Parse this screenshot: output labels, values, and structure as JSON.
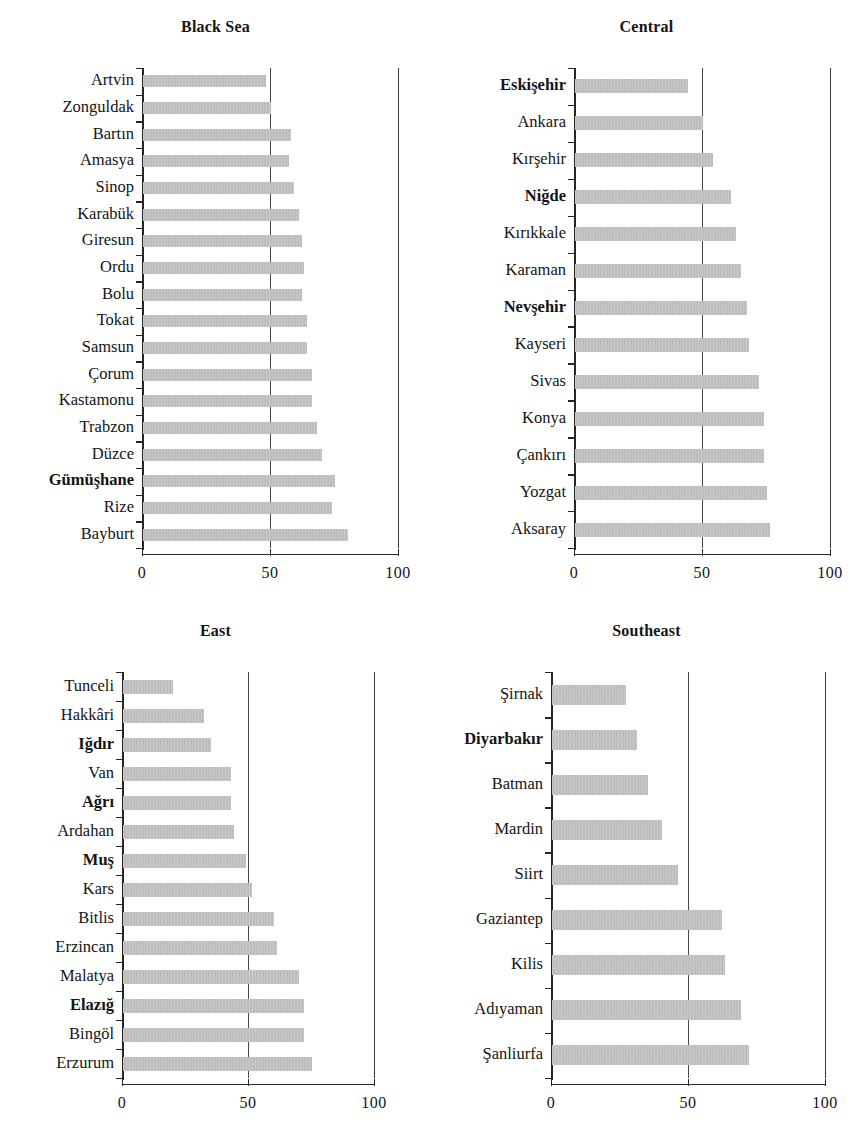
{
  "figure": {
    "background": "#ffffff",
    "bar_color": "#b9b9b9",
    "axis_color": "#262626"
  },
  "chart_data": {
    "type": "bar",
    "orientation": "horizontal",
    "title": "",
    "xlabel": "",
    "ylabel": "",
    "xlim": [
      0,
      100
    ],
    "xticks": [
      0,
      50,
      100
    ],
    "xtick_labels": [
      "0",
      "50",
      "100"
    ],
    "grid": false,
    "reference_lines": [
      50,
      100
    ],
    "panels": [
      {
        "title": "Black Sea",
        "categories": [
          "Artvin",
          "Zonguldak",
          "Bartın",
          "Amasya",
          "Sinop",
          "Karabük",
          "Giresun",
          "Ordu",
          "Bolu",
          "Tokat",
          "Samsun",
          "Çorum",
          "Kastamonu",
          "Trabzon",
          "Düzce",
          "Gümüşhane",
          "Rize",
          "Bayburt"
        ],
        "values": [
          48,
          50,
          58,
          57,
          59,
          61,
          62,
          63,
          62,
          64,
          64,
          66,
          66,
          68,
          70,
          75,
          74,
          80
        ],
        "bold_labels": [
          "Gümüşhane"
        ]
      },
      {
        "title": "Central",
        "categories": [
          "Eskişehir",
          "Ankara",
          "Kırşehir",
          "Niğde",
          "Kırıkkale",
          "Karaman",
          "Nevşehir",
          "Kayseri",
          "Sivas",
          "Konya",
          "Çankırı",
          "Yozgat",
          "Aksaray"
        ],
        "values": [
          44,
          50,
          54,
          61,
          63,
          65,
          67,
          68,
          72,
          74,
          74,
          75,
          76
        ],
        "bold_labels": [
          "Eskişehir",
          "Niğde",
          "Nevşehir"
        ]
      },
      {
        "title": "East",
        "categories": [
          "Tunceli",
          "Hakkâri",
          "Iğdır",
          "Van",
          "Ağrı",
          "Ardahan",
          "Muş",
          "Kars",
          "Bitlis",
          "Erzincan",
          "Malatya",
          "Elazığ",
          "Bingöl",
          "Erzurum"
        ],
        "values": [
          20,
          32,
          35,
          43,
          43,
          44,
          49,
          51,
          60,
          61,
          70,
          72,
          72,
          75
        ],
        "bold_labels": [
          "Iğdır",
          "Ağrı",
          "Muş",
          "Elazığ"
        ]
      },
      {
        "title": "Southeast",
        "categories": [
          "Şirnak",
          "Diyarbakır",
          "Batman",
          "Mardin",
          "Siirt",
          "Gaziantep",
          "Kilis",
          "Adıyaman",
          "Şanliurfa"
        ],
        "values": [
          27,
          31,
          35,
          40,
          46,
          62,
          63,
          69,
          72
        ],
        "bold_labels": [
          "Diyarbakır"
        ]
      }
    ]
  }
}
